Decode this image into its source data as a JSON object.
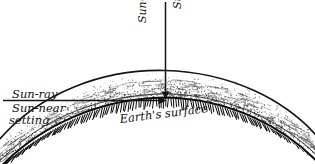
{
  "diagram": {
    "style": "hand-drawn line diagram",
    "background_color": "#ffffff",
    "ink_color": "#111111",
    "labels": {
      "sun_ray_horizontal": "Sun-ray",
      "sun_near_setting_line1": "Sun-near",
      "sun_near_setting_line2": "setting",
      "sun_ray_vertical": "Sun-ray",
      "sun_at_zenith": "Sun at zenith",
      "earths_surface": "Earth's surface"
    },
    "elements": {
      "outer_arc_name": "top-of-atmosphere-arc",
      "inner_arc_name": "earth-surface-arc",
      "hatching_name": "earth-interior-hatching",
      "stipple_name": "atmosphere-stipple",
      "vertical_ray_name": "zenith-sun-ray-arrow",
      "horizontal_ray_name": "setting-sun-ray-arrow"
    }
  },
  "chart_data": {
    "type": "diagram",
    "annotations": [
      {
        "text": "Sun-ray",
        "orientation": "vertical",
        "position": "above zenith ray, left side"
      },
      {
        "text": "Sun at zenith",
        "orientation": "vertical",
        "position": "above zenith ray, right side"
      },
      {
        "text": "Sun-ray",
        "orientation": "horizontal",
        "position": "upper-left, above horizontal ray"
      },
      {
        "text": "Sun-near setting",
        "orientation": "horizontal",
        "position": "upper-left, below horizontal ray"
      },
      {
        "text": "Earth's surface",
        "orientation": "along-curve",
        "position": "centre, on inner arc"
      }
    ],
    "curves": [
      {
        "name": "top-of-atmosphere-arc",
        "description": "outer curved boundary of atmosphere"
      },
      {
        "name": "earth-surface-arc",
        "description": "inner curved boundary, hatched below"
      }
    ],
    "rays": [
      {
        "name": "zenith-sun-ray",
        "direction": "downward-vertical",
        "terminates_at": "earth surface at arc apex"
      },
      {
        "name": "setting-sun-ray",
        "direction": "rightward-horizontal",
        "terminates_at": "earth surface at arc apex"
      }
    ]
  }
}
